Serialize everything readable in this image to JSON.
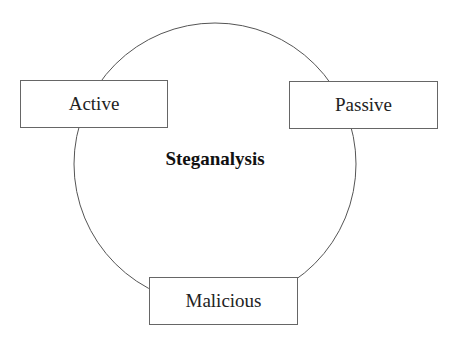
{
  "diagram": {
    "center_label": "Steganalysis",
    "nodes": [
      {
        "label": "Active"
      },
      {
        "label": "Passive"
      },
      {
        "label": "Malicious"
      }
    ]
  }
}
